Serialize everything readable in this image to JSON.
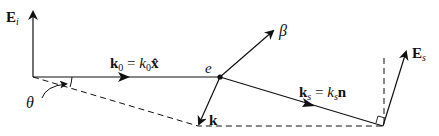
{
  "diagram": {
    "title": "",
    "colors": {
      "ink": "#111111",
      "background": "#ffffff"
    },
    "labels": {
      "incident_field": {
        "main": "E",
        "sub": "i"
      },
      "incident_wavevector": {
        "lhs_main": "k",
        "lhs_sub": "0",
        "eq": " = ",
        "rhs_main": "k",
        "rhs_sub": "0",
        "rhs_vec": "x̂"
      },
      "electron": "e",
      "velocity": "β",
      "k_vector": "k",
      "scattered_wavevector": {
        "lhs_main": "k",
        "lhs_sub": "s",
        "eq": " = ",
        "rhs_main": "k",
        "rhs_sub": "s",
        "rhs_vec": "n"
      },
      "scattered_field": {
        "main": "E",
        "sub": "s"
      },
      "angle": "θ"
    }
  }
}
